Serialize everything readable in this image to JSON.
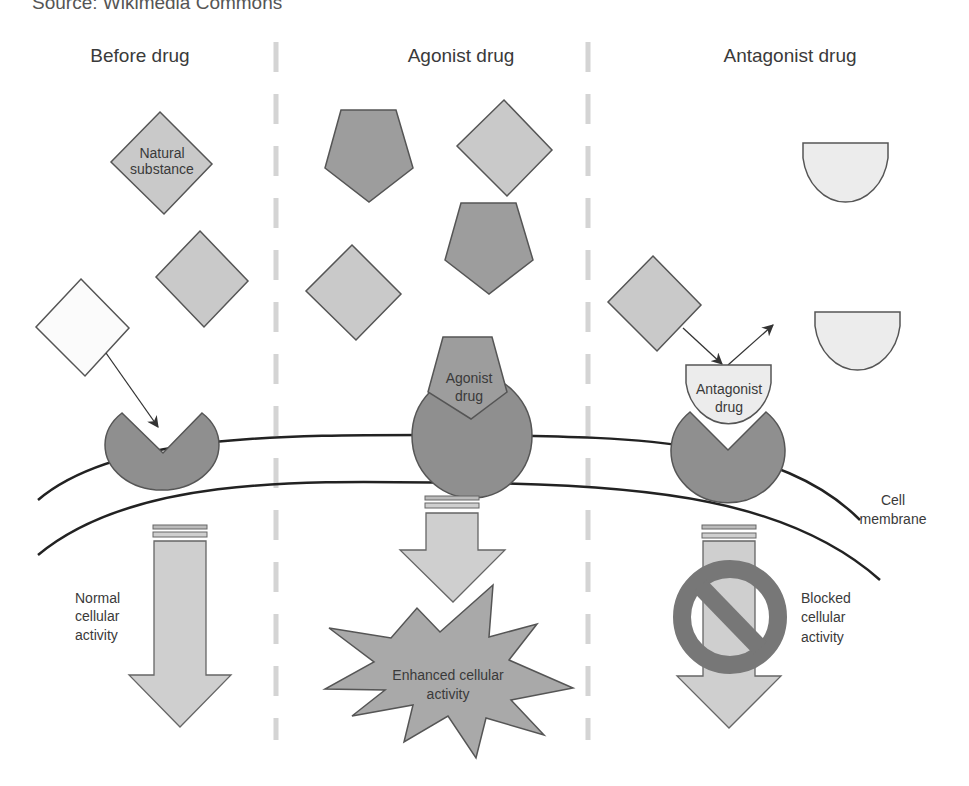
{
  "source_caption": "Source: Wikimedia Commons",
  "panels": [
    {
      "title": "Before drug",
      "ligand_label_line1": "Natural",
      "ligand_label_line2": "substance",
      "outcome_line1": "Normal",
      "outcome_line2": "cellular",
      "outcome_line3": "activity"
    },
    {
      "title": "Agonist drug",
      "drug_label_line1": "Agonist",
      "drug_label_line2": "drug",
      "outcome_line1": "Enhanced cellular",
      "outcome_line2": "activity"
    },
    {
      "title": "Antagonist drug",
      "drug_label_line1": "Antagonist",
      "drug_label_line2": "drug",
      "outcome_line1": "Blocked",
      "outcome_line2": "cellular",
      "outcome_line3": "activity"
    }
  ],
  "membrane_label_line1": "Cell",
  "membrane_label_line2": "membrane",
  "colors": {
    "receptor": "#8f8f8f",
    "natural_substance": "#c9c9c9",
    "agonist": "#9d9d9d",
    "antagonist": "#ececec",
    "arrow_fill": "#cfcfcf",
    "outline": "#555555",
    "divider": "#d4d4d4",
    "prohibition": "#777777"
  }
}
